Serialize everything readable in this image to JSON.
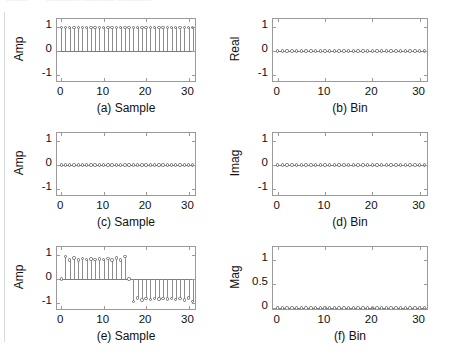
{
  "figure": {
    "scan_artifact_top_left": "——",
    "scan_artifact_top_mid": "——— ——— ———",
    "background_color": "#ffffff",
    "axis_color": "#9a9a9a",
    "stem_color": "#8d8d8d",
    "marker_color": "#6e6e6e",
    "baseline_color": "#7c7c7c"
  },
  "chart_data": [
    {
      "type": "line",
      "panel_id": "a",
      "title": "(a) Sample",
      "xlabel": "(a) Sample",
      "ylabel": "Amp",
      "x": [
        0,
        1,
        2,
        3,
        4,
        5,
        6,
        7,
        8,
        9,
        10,
        11,
        12,
        13,
        14,
        15,
        16,
        17,
        18,
        19,
        20,
        21,
        22,
        23,
        24,
        25,
        26,
        27,
        28,
        29,
        30,
        31
      ],
      "values": [
        1,
        1,
        1,
        1,
        1,
        1,
        1,
        1,
        1,
        1,
        1,
        1,
        1,
        1,
        1,
        1,
        1,
        1,
        1,
        1,
        1,
        1,
        1,
        1,
        1,
        1,
        1,
        1,
        1,
        1,
        1,
        1
      ],
      "xlim": [
        -1,
        32
      ],
      "ylim": [
        -1.35,
        1.35
      ],
      "xticks": [
        0,
        10,
        20,
        30
      ],
      "xticklabels": [
        "0",
        "10",
        "20",
        "30"
      ],
      "yticks": [
        -1,
        0,
        1
      ],
      "yticklabels": [
        "-1",
        "0",
        "1"
      ],
      "grid": false,
      "legend": null,
      "marker": "open-circle",
      "stem": true,
      "baseline": 0
    },
    {
      "type": "line",
      "panel_id": "b",
      "title": "(b) Bin",
      "xlabel": "(b) Bin",
      "ylabel": "Real",
      "x": [
        0,
        1,
        2,
        3,
        4,
        5,
        6,
        7,
        8,
        9,
        10,
        11,
        12,
        13,
        14,
        15,
        16,
        17,
        18,
        19,
        20,
        21,
        22,
        23,
        24,
        25,
        26,
        27,
        28,
        29,
        30,
        31
      ],
      "values": [
        0,
        0,
        0,
        0,
        0,
        0,
        0,
        0,
        0,
        0,
        0,
        0,
        0,
        0,
        0,
        0,
        0,
        0,
        0,
        0,
        0,
        0,
        0,
        0,
        0,
        0,
        0,
        0,
        0,
        0,
        0,
        0
      ],
      "xlim": [
        -1,
        32
      ],
      "ylim": [
        -1.35,
        1.35
      ],
      "xticks": [
        0,
        10,
        20,
        30
      ],
      "xticklabels": [
        "0",
        "10",
        "20",
        "30"
      ],
      "yticks": [
        -1,
        0,
        1
      ],
      "yticklabels": [
        "-1",
        "0",
        "1"
      ],
      "grid": false,
      "legend": null,
      "marker": "open-circle",
      "stem": true,
      "baseline": 0
    },
    {
      "type": "line",
      "panel_id": "c",
      "title": "(c) Sample",
      "xlabel": "(c) Sample",
      "ylabel": "Amp",
      "x": [
        0,
        1,
        2,
        3,
        4,
        5,
        6,
        7,
        8,
        9,
        10,
        11,
        12,
        13,
        14,
        15,
        16,
        17,
        18,
        19,
        20,
        21,
        22,
        23,
        24,
        25,
        26,
        27,
        28,
        29,
        30,
        31
      ],
      "values": [
        0,
        0,
        0,
        0,
        0,
        0,
        0,
        0,
        0,
        0,
        0,
        0,
        0,
        0,
        0,
        0,
        0,
        0,
        0,
        0,
        0,
        0,
        0,
        0,
        0,
        0,
        0,
        0,
        0,
        0,
        0,
        0
      ],
      "xlim": [
        -1,
        32
      ],
      "ylim": [
        -1.35,
        1.35
      ],
      "xticks": [
        0,
        10,
        20,
        30
      ],
      "xticklabels": [
        "0",
        "10",
        "20",
        "30"
      ],
      "yticks": [
        -1,
        0,
        1
      ],
      "yticklabels": [
        "-1",
        "0",
        "1"
      ],
      "grid": false,
      "legend": null,
      "marker": "open-circle",
      "stem": true,
      "baseline": 0
    },
    {
      "type": "line",
      "panel_id": "d",
      "title": "(d) Bin",
      "xlabel": "(d) Bin",
      "ylabel": "Imag",
      "x": [
        0,
        1,
        2,
        3,
        4,
        5,
        6,
        7,
        8,
        9,
        10,
        11,
        12,
        13,
        14,
        15,
        16,
        17,
        18,
        19,
        20,
        21,
        22,
        23,
        24,
        25,
        26,
        27,
        28,
        29,
        30,
        31
      ],
      "values": [
        0,
        0,
        0,
        0,
        0,
        0,
        0,
        0,
        0,
        0,
        0,
        0,
        0,
        0,
        0,
        0,
        0,
        0,
        0,
        0,
        0,
        0,
        0,
        0,
        0,
        0,
        0,
        0,
        0,
        0,
        0,
        0
      ],
      "xlim": [
        -1,
        32
      ],
      "ylim": [
        -1.35,
        1.35
      ],
      "xticks": [
        0,
        10,
        20,
        30
      ],
      "xticklabels": [
        "0",
        "10",
        "20",
        "30"
      ],
      "yticks": [
        -1,
        0,
        1
      ],
      "yticklabels": [
        "-1",
        "0",
        "1"
      ],
      "grid": false,
      "legend": null,
      "marker": "open-circle",
      "stem": true,
      "baseline": 0
    },
    {
      "type": "line",
      "panel_id": "e",
      "title": "(e) Sample",
      "xlabel": "(e) Sample",
      "ylabel": "Amp",
      "x": [
        0,
        1,
        2,
        3,
        4,
        5,
        6,
        7,
        8,
        9,
        10,
        11,
        12,
        13,
        14,
        15,
        16,
        17,
        18,
        19,
        20,
        21,
        22,
        23,
        24,
        25,
        26,
        27,
        28,
        29,
        30,
        31
      ],
      "values": [
        0,
        0.95,
        0.8,
        0.88,
        0.81,
        0.86,
        0.82,
        0.85,
        0.83,
        0.85,
        0.82,
        0.86,
        0.81,
        0.88,
        0.8,
        0.95,
        0,
        -0.95,
        -0.8,
        -0.88,
        -0.81,
        -0.86,
        -0.82,
        -0.85,
        -0.83,
        -0.85,
        -0.82,
        -0.86,
        -0.81,
        -0.88,
        -0.8,
        -0.95
      ],
      "xlim": [
        -1,
        32
      ],
      "ylim": [
        -1.35,
        1.35
      ],
      "xticks": [
        0,
        10,
        20,
        30
      ],
      "xticklabels": [
        "0",
        "10",
        "20",
        "30"
      ],
      "yticks": [
        -1,
        0,
        1
      ],
      "yticklabels": [
        "-1",
        "0",
        "1"
      ],
      "grid": false,
      "legend": null,
      "marker": "open-circle",
      "stem": true,
      "baseline": 0
    },
    {
      "type": "line",
      "panel_id": "f",
      "title": "(f) Bin",
      "xlabel": "(f) Bin",
      "ylabel": "Mag",
      "x": [
        0,
        1,
        2,
        3,
        4,
        5,
        6,
        7,
        8,
        9,
        10,
        11,
        12,
        13,
        14,
        15,
        16,
        17,
        18,
        19,
        20,
        21,
        22,
        23,
        24,
        25,
        26,
        27,
        28,
        29,
        30,
        31
      ],
      "values": [
        0,
        0,
        0,
        0,
        0,
        0,
        0,
        0,
        0,
        0,
        0,
        0,
        0,
        0,
        0,
        0,
        0,
        0,
        0,
        0,
        0,
        0,
        0,
        0,
        0,
        0,
        0,
        0,
        0,
        0,
        0,
        0
      ],
      "xlim": [
        -1,
        32
      ],
      "ylim": [
        -0.06,
        1.26
      ],
      "xticks": [
        0,
        10,
        20,
        30
      ],
      "xticklabels": [
        "0",
        "10",
        "20",
        "30"
      ],
      "yticks": [
        0,
        0.5,
        1
      ],
      "yticklabels": [
        "0",
        "0.5",
        "1"
      ],
      "grid": false,
      "legend": null,
      "marker": "open-circle",
      "stem": true,
      "baseline": 0
    }
  ]
}
